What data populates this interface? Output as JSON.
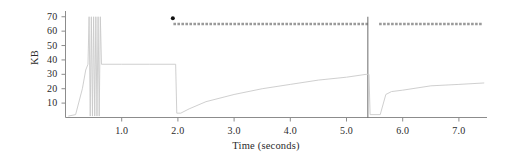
{
  "chart_data": {
    "type": "line",
    "title": "",
    "xlabel": "Time (seconds)",
    "ylabel": "KB",
    "xlim": [
      0.0,
      7.5
    ],
    "ylim": [
      0,
      74
    ],
    "grid": false,
    "legend": "none",
    "xticks": [
      1.0,
      2.0,
      3.0,
      4.0,
      5.0,
      6.0,
      7.0
    ],
    "xtick_labels": [
      "1.0",
      "2.0",
      "3.0",
      "4.0",
      "5.0",
      "6.0",
      "7.0"
    ],
    "yticks": [
      10,
      20,
      30,
      40,
      50,
      60,
      70
    ],
    "ytick_labels": [
      "10",
      "20",
      "30",
      "40",
      "50",
      "60",
      "70"
    ],
    "series": [
      {
        "name": "buffer-occupancy",
        "style": "solid",
        "color": "#c9c9c9",
        "points": [
          [
            0.05,
            1
          ],
          [
            0.18,
            2
          ],
          [
            0.3,
            20
          ],
          [
            0.36,
            33
          ],
          [
            0.4,
            37
          ],
          [
            0.42,
            70
          ],
          [
            0.44,
            1
          ],
          [
            0.46,
            70
          ],
          [
            0.48,
            1
          ],
          [
            0.5,
            70
          ],
          [
            0.52,
            1
          ],
          [
            0.54,
            70
          ],
          [
            0.56,
            1
          ],
          [
            0.58,
            70
          ],
          [
            0.6,
            1
          ],
          [
            0.62,
            70
          ],
          [
            0.64,
            37
          ],
          [
            1.0,
            37
          ],
          [
            1.5,
            37
          ],
          [
            1.96,
            37
          ],
          [
            1.98,
            3
          ],
          [
            2.05,
            3
          ],
          [
            2.2,
            6
          ],
          [
            2.5,
            11
          ],
          [
            3.0,
            16
          ],
          [
            3.5,
            20
          ],
          [
            4.0,
            23
          ],
          [
            4.5,
            26
          ],
          [
            5.0,
            28
          ],
          [
            5.35,
            30
          ],
          [
            5.4,
            30
          ],
          [
            5.42,
            2
          ],
          [
            5.6,
            2
          ],
          [
            5.7,
            16
          ],
          [
            5.8,
            18
          ],
          [
            6.0,
            19
          ],
          [
            6.5,
            22
          ],
          [
            7.0,
            23
          ],
          [
            7.45,
            24
          ]
        ]
      },
      {
        "name": "receiver-window",
        "style": "dashed",
        "color": "#9a9a9a",
        "points": [
          [
            1.92,
            65
          ],
          [
            5.38,
            65
          ],
          [
            5.58,
            65
          ],
          [
            7.42,
            65
          ]
        ],
        "gap": [
          5.38,
          5.58
        ]
      }
    ],
    "markers": [
      {
        "name": "event-marker",
        "x": 1.91,
        "y": 69,
        "shape": "circle",
        "color": "#111111",
        "size": 4
      }
    ],
    "annotations": [
      {
        "name": "retransmit-event-line",
        "type": "vline",
        "x": 5.38,
        "y_from": 0,
        "y_to": 70,
        "color": "#5a5a5a"
      }
    ]
  },
  "axes": {
    "spine_color": "#8c8c8c",
    "tick_color": "#8c8c8c",
    "text_color": "#2b2b2b"
  }
}
